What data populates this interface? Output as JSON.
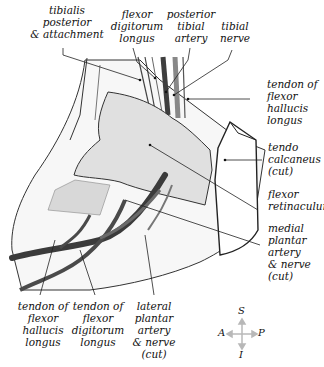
{
  "diagram": {
    "labels": {
      "tibialis_posterior": "tibialis\nposterior\n& attachment",
      "flexor_digitorum_longus_top": "flexor\ndigitorum\nlongus",
      "posterior_tibial_artery": "posterior\ntibial\nartery",
      "tibial_nerve": "tibial\nnerve",
      "tendon_fhl_right": "tendon of\nflexor\nhallucis\nlongus",
      "tendo_calcaneus": "tendo\ncalcaneus\n(cut)",
      "flexor_retinaculum": "flexor\nretinaculum",
      "medial_plantar": "medial\nplantar\nartery\n& nerve\n(cut)",
      "tendon_fhl_bottom": "tendon of\nflexor\nhallucis\nlongus",
      "tendon_fdl_bottom": "tendon of\nflexor\ndigitorum\nlongus",
      "lateral_plantar": "lateral\nplantar\nartery\n& nerve\n(cut)"
    },
    "compass": {
      "S": "S",
      "I": "I",
      "A": "A",
      "P": "P"
    },
    "colors": {
      "retinaculum_fill": "#e0e0e0",
      "vessel": "#4a4a4a",
      "outline": "#222222",
      "compass_arrow": "#b8b8b8"
    }
  }
}
